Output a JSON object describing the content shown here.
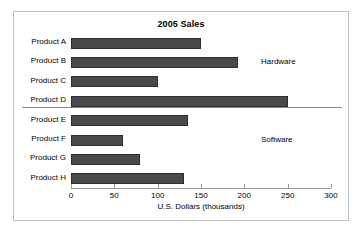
{
  "figure": {
    "border_color": "#bfbfbf",
    "background": "#ffffff"
  },
  "chart_data": {
    "type": "bar",
    "orientation": "horizontal",
    "title": "2005 Sales",
    "xlabel": "U.S. Dollars (thousands)",
    "ylabel": "",
    "xlim": [
      0,
      300
    ],
    "xticks": [
      0,
      50,
      100,
      150,
      200,
      250,
      300
    ],
    "xtick_labels": [
      "0",
      "50",
      "100",
      "150",
      "200",
      "250",
      "300"
    ],
    "grid": false,
    "legend": "none",
    "bar_color": "#4a4a4a",
    "bar_edge_color": "#2e2e2e",
    "categories": [
      "Product A",
      "Product B",
      "Product C",
      "Product D",
      "Product E",
      "Product F",
      "Product G",
      "Product H"
    ],
    "values": [
      150,
      193,
      100,
      250,
      135,
      60,
      80,
      130
    ],
    "groups": [
      {
        "label": "Hardware",
        "categories": [
          "Product A",
          "Product B",
          "Product C",
          "Product D"
        ]
      },
      {
        "label": "Software",
        "categories": [
          "Product E",
          "Product F",
          "Product G",
          "Product H"
        ]
      }
    ],
    "annotations": [
      {
        "text": "Hardware",
        "position": "right-of-plot-upper-group"
      },
      {
        "text": "Software",
        "position": "right-of-plot-lower-group"
      }
    ]
  }
}
